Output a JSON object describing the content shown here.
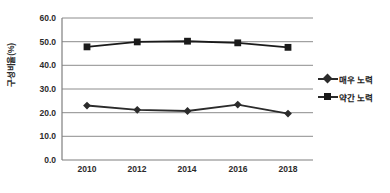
{
  "chart_data": {
    "type": "line",
    "title": "",
    "xlabel": "",
    "ylabel": "구성비율(%)",
    "categories": [
      "2010",
      "2012",
      "2014",
      "2016",
      "2018"
    ],
    "series": [
      {
        "name": "매우 노력",
        "marker": "diamond",
        "values": [
          23.0,
          21.2,
          20.7,
          23.4,
          19.6
        ]
      },
      {
        "name": "약간 노력",
        "marker": "square",
        "values": [
          47.8,
          49.9,
          50.2,
          49.5,
          47.6
        ]
      }
    ],
    "ylim": [
      0.0,
      60.0
    ],
    "ytick_labels": [
      "60.0",
      "50.0",
      "40.0",
      "30.0",
      "20.0",
      "10.0",
      "0.0"
    ],
    "ytick_values": [
      60.0,
      50.0,
      40.0,
      30.0,
      20.0,
      10.0,
      0.0
    ],
    "grid": true,
    "legend_position": "right",
    "colors": {
      "series1": "#2b2b2b",
      "series2": "#1a1a1a",
      "grid": "#8c8c8c",
      "axis": "#7f7f7f",
      "text": "#2b2b2b",
      "background": "#ffffff"
    }
  },
  "axis": {
    "y_title": "구성비율(%)"
  },
  "legend": {
    "items": [
      {
        "label": "매우 노력"
      },
      {
        "label": "약간 노력"
      }
    ]
  }
}
